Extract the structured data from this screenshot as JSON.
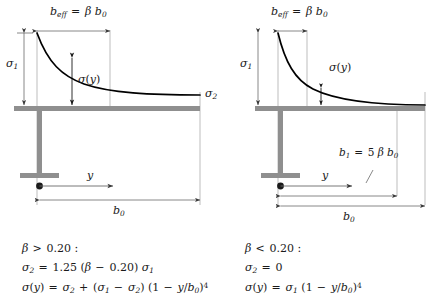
{
  "figure": {
    "type": "engineering-diagram",
    "colors": {
      "beam": "#8f8f8f",
      "curve": "#000000",
      "dimension_line": "#6a6a6a",
      "guide_line": "#9a9a9a",
      "text": "#1a1a1a",
      "background": "#ffffff"
    }
  },
  "panels": [
    {
      "id": "left",
      "case_label": "beta greater than 0.20",
      "labels": {
        "b_eff": {
          "var": "b",
          "sub": "eff",
          "eq": "=",
          "rhs_beta": "β",
          "rhs_var": "b",
          "rhs_sub": "0"
        },
        "sigma_1": {
          "var": "σ",
          "sub": "1"
        },
        "sigma_2": {
          "var": "σ",
          "sub": "2"
        },
        "sigma_y": {
          "var": "σ",
          "open": "(",
          "arg": "y",
          "close": ")"
        },
        "y_axis": {
          "var": "y"
        },
        "b_0": {
          "var": "b",
          "sub": "0"
        }
      },
      "equations": {
        "condition": {
          "beta": "β",
          "op": ">",
          "value": "0.20",
          "colon": ":"
        },
        "sigma2": {
          "lhs_var": "σ",
          "lhs_sub": "2",
          "eq": "=",
          "coef": "1.25",
          "open": "(",
          "beta": "β",
          "minus": "−",
          "value": "0.20",
          "close": ")",
          "tail_var": "σ",
          "tail_sub": "1"
        },
        "sigma_profile": {
          "lhs": "σ",
          "lhs_open": "(",
          "lhs_arg": "y",
          "lhs_close": ")",
          "eq": "=",
          "t1_var": "σ",
          "t1_sub": "2",
          "plus": "+",
          "t2_open": "(",
          "t2_a": "σ",
          "t2_a_sub": "1",
          "t2_minus": "−",
          "t2_b": "σ",
          "t2_b_sub": "2",
          "t2_close": ")",
          "t3_open": "(",
          "t3_one": "1",
          "t3_minus": "−",
          "t3_y": "y",
          "t3_slash": "/",
          "t3_b": "b",
          "t3_b_sub": "0",
          "t3_close": ")",
          "t3_exp": "4"
        }
      }
    },
    {
      "id": "right",
      "case_label": "beta less than 0.20",
      "labels": {
        "b_eff": {
          "var": "b",
          "sub": "eff",
          "eq": "=",
          "rhs_beta": "β",
          "rhs_var": "b",
          "rhs_sub": "0"
        },
        "sigma_1": {
          "var": "σ",
          "sub": "1"
        },
        "sigma_y": {
          "var": "σ",
          "open": "(",
          "arg": "y",
          "close": ")"
        },
        "y_axis": {
          "var": "y"
        },
        "b_1": {
          "var": "b",
          "sub": "1",
          "eq": "=",
          "coef": "5",
          "beta": "β",
          "rhs_var": "b",
          "rhs_sub": "0"
        },
        "b_0": {
          "var": "b",
          "sub": "0"
        }
      },
      "equations": {
        "condition": {
          "beta": "β",
          "op": "<",
          "value": "0.20",
          "colon": ":"
        },
        "sigma2": {
          "lhs_var": "σ",
          "lhs_sub": "2",
          "eq": "=",
          "value": "0"
        },
        "sigma_profile": {
          "lhs": "σ",
          "lhs_open": "(",
          "lhs_arg": "y",
          "lhs_close": ")",
          "eq": "=",
          "t1_var": "σ",
          "t1_sub": "1",
          "t3_open": "(",
          "t3_one": "1",
          "t3_minus": "−",
          "t3_y": "y",
          "t3_slash": "/",
          "t3_b": "b",
          "t3_b_sub": "0",
          "t3_close": ")",
          "t3_exp": "4"
        }
      }
    }
  ]
}
